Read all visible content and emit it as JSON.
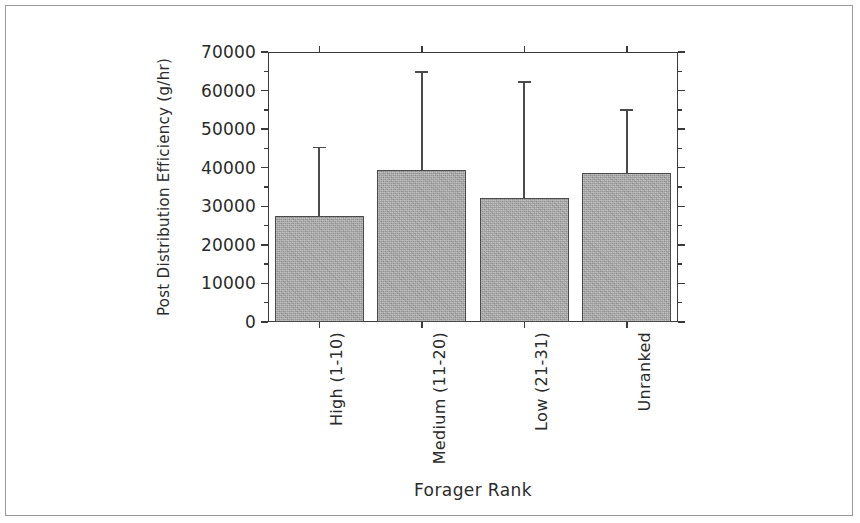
{
  "chart_data": {
    "type": "bar",
    "title": "",
    "subtitle": "",
    "xlabel": "Forager Rank",
    "ylabel": "Post Distribution Efficiency (g/hr)",
    "categories": [
      "High (1-10)",
      "Medium (11-20)",
      "Low (21-31)",
      "Unranked"
    ],
    "values": [
      27500,
      39500,
      32200,
      38600
    ],
    "error_upper": [
      45500,
      65000,
      62500,
      55200
    ],
    "errors": [
      18000,
      25500,
      30300,
      16600
    ],
    "ylim": [
      0,
      70000
    ],
    "ytick_labels": [
      "0",
      "10000",
      "20000",
      "30000",
      "40000",
      "50000",
      "60000",
      "70000"
    ],
    "ytick_values": [
      0,
      10000,
      20000,
      30000,
      40000,
      50000,
      60000,
      70000
    ],
    "yminor_interval": 5000,
    "grid": false,
    "legend": "none",
    "bar_fill_color": "#a9a9a9",
    "bar_edge_color": "#4a4a4a",
    "axis_color": "#3a3a3a",
    "error_bar_style": "upper-only-with-cap"
  }
}
